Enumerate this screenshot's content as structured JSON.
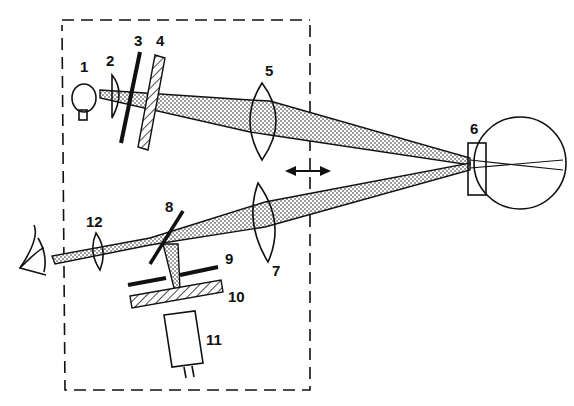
{
  "diagram": {
    "type": "optical schematic",
    "housing": "dashed boundary enclosing components 1-5, 7-12",
    "movement_indicator": "double-headed horizontal arrow (component assembly moves along axis)",
    "components": [
      {
        "id": "1",
        "label": "1",
        "shape": "light bulb"
      },
      {
        "id": "2",
        "label": "2",
        "shape": "condenser lens"
      },
      {
        "id": "3",
        "label": "3",
        "shape": "slit / aperture plate"
      },
      {
        "id": "4",
        "label": "4",
        "shape": "hatched filter"
      },
      {
        "id": "5",
        "label": "5",
        "shape": "biconvex lens"
      },
      {
        "id": "6",
        "label": "6",
        "shape": "contact lens on eye"
      },
      {
        "id": "7",
        "label": "7",
        "shape": "biconvex lens"
      },
      {
        "id": "8",
        "label": "8",
        "shape": "beam splitter"
      },
      {
        "id": "9",
        "label": "9",
        "shape": "aperture plate"
      },
      {
        "id": "10",
        "label": "10",
        "shape": "hatched filter"
      },
      {
        "id": "11",
        "label": "11",
        "shape": "detector / camera"
      },
      {
        "id": "12",
        "label": "12",
        "shape": "eyepiece lens"
      }
    ],
    "observer": "eye of observer at left"
  }
}
